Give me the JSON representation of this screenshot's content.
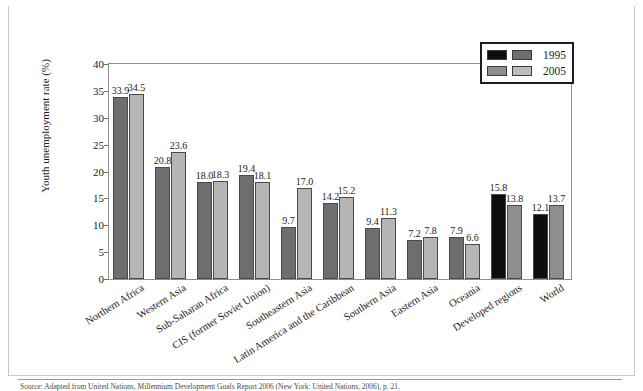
{
  "figure": {
    "number_label": "FIGURE 7.10",
    "title": "Youth Unemployment Rates, 1995 and 2005"
  },
  "legend": {
    "rows": [
      {
        "label": "1995",
        "swatch_a": "#0d0d0d",
        "swatch_b": "#6e6e6e"
      },
      {
        "label": "2005",
        "swatch_a": "#8e8e8e",
        "swatch_b": "#bdbdbd"
      }
    ]
  },
  "colors": {
    "series_1995_gray": "#6e6e6e",
    "series_1995_black": "#0d0d0d",
    "series_2005_gray": "#8e8e8e",
    "series_2005_light": "#bdbdbd",
    "header_bar": "#8d8d8d",
    "frame": "#8e8e8e"
  },
  "source_note": "Source: Adapted from United Nations, Millennium Development Goals Report 2006 (New York: United Nations, 2006), p. 21.",
  "chart_data": {
    "type": "bar",
    "title": "Youth Unemployment Rates, 1995 and 2005",
    "xlabel": "",
    "ylabel": "Youth unemployment rate (%)",
    "ylim": [
      0,
      40
    ],
    "ytick_step": 5,
    "yticks": [
      0,
      5,
      10,
      15,
      20,
      25,
      30,
      35,
      40
    ],
    "grid": false,
    "legend_position": "top-right",
    "categories": [
      "Northern Africa",
      "Western Asia",
      "Sub-Saharan Africa",
      "CIS (former Soviet Union)",
      "Southeastern Asia",
      "Latin America and the Caribbean",
      "Southern Asia",
      "Eastern Asia",
      "Oceania",
      "Developed regions",
      "World"
    ],
    "series": [
      {
        "name": "1995",
        "values": [
          33.9,
          20.8,
          18.0,
          19.4,
          9.7,
          14.2,
          9.4,
          7.2,
          7.9,
          15.8,
          12.1
        ],
        "bar_colors": [
          "#6e6e6e",
          "#6e6e6e",
          "#6e6e6e",
          "#6e6e6e",
          "#6e6e6e",
          "#6e6e6e",
          "#6e6e6e",
          "#6e6e6e",
          "#6e6e6e",
          "#0d0d0d",
          "#0d0d0d"
        ]
      },
      {
        "name": "2005",
        "values": [
          34.5,
          23.6,
          18.3,
          18.1,
          17.0,
          15.2,
          11.3,
          7.8,
          6.6,
          13.8,
          13.7
        ],
        "bar_colors": [
          "#b5b5b5",
          "#b5b5b5",
          "#b5b5b5",
          "#b5b5b5",
          "#b5b5b5",
          "#b5b5b5",
          "#b5b5b5",
          "#b5b5b5",
          "#b5b5b5",
          "#8e8e8e",
          "#8e8e8e"
        ]
      }
    ]
  }
}
